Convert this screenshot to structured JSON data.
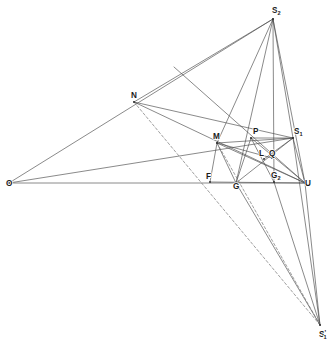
{
  "figure": {
    "kind": "geometry-diagram",
    "background_color": "#ffffff",
    "line_color": "#4a4a4a",
    "line_color_dark": "#3a3a3a",
    "label_color": "#1c1c1c",
    "width": 334,
    "height": 342
  },
  "points": {
    "O": {
      "label": "O",
      "sub": "",
      "prime": "",
      "x": 9,
      "y": 183,
      "label_x": 6,
      "label_y": 186
    },
    "N": {
      "label": "N",
      "sub": "",
      "prime": "",
      "x": 134,
      "y": 102,
      "label_x": 131,
      "label_y": 98
    },
    "M": {
      "label": "M",
      "sub": "",
      "prime": "",
      "x": 217,
      "y": 143,
      "label_x": 213,
      "label_y": 139
    },
    "P": {
      "label": "P",
      "sub": "",
      "prime": "",
      "x": 251,
      "y": 138,
      "label_x": 253,
      "label_y": 134
    },
    "S1": {
      "label": "S",
      "sub": "1",
      "prime": "",
      "x": 293,
      "y": 138,
      "label_x": 294,
      "label_y": 134
    },
    "S2": {
      "label": "S",
      "sub": "2",
      "prime": "",
      "x": 273,
      "y": 19,
      "label_x": 272,
      "label_y": 13
    },
    "S1p": {
      "label": "S",
      "sub": "1",
      "prime": "'",
      "x": 320,
      "y": 325,
      "label_x": 319,
      "label_y": 337
    },
    "L": {
      "label": "L",
      "sub": "",
      "prime": "",
      "x": 264,
      "y": 159,
      "label_x": 259,
      "label_y": 156
    },
    "Q": {
      "label": "Q",
      "sub": "",
      "prime": "",
      "x": 272,
      "y": 158,
      "label_x": 269,
      "label_y": 156
    },
    "F": {
      "label": "F",
      "sub": "",
      "prime": "",
      "x": 210,
      "y": 182,
      "label_x": 206,
      "label_y": 179
    },
    "G": {
      "label": "G",
      "sub": "",
      "prime": "",
      "x": 236,
      "y": 183,
      "label_x": 233,
      "label_y": 189
    },
    "G2": {
      "label": "G",
      "sub": "2",
      "prime": "",
      "x": 274,
      "y": 182,
      "label_x": 271,
      "label_y": 178
    },
    "U": {
      "label": "U",
      "sub": "",
      "prime": "",
      "x": 305,
      "y": 183,
      "label_x": 305,
      "label_y": 186
    },
    "T": {
      "label": "",
      "sub": "",
      "prime": "",
      "x": 174,
      "y": 67,
      "label_x": 0,
      "label_y": 0
    }
  },
  "solid_segments": [
    [
      "O",
      "S2"
    ],
    [
      "O",
      "S1"
    ],
    [
      "O",
      "U"
    ],
    [
      "N",
      "S2"
    ],
    [
      "N",
      "U"
    ],
    [
      "N",
      "S1"
    ],
    [
      "S2",
      "M"
    ],
    [
      "S2",
      "G"
    ],
    [
      "S2",
      "G2"
    ],
    [
      "S2",
      "S1"
    ],
    [
      "S2",
      "U"
    ],
    [
      "M",
      "S1"
    ],
    [
      "M",
      "G"
    ],
    [
      "M",
      "F"
    ],
    [
      "M",
      "Q"
    ],
    [
      "M",
      "U"
    ],
    [
      "P",
      "G"
    ],
    [
      "P",
      "U"
    ],
    [
      "P",
      "G2"
    ],
    [
      "P",
      "S1"
    ],
    [
      "S1",
      "G"
    ],
    [
      "S1",
      "U"
    ],
    [
      "S1",
      "S1p"
    ],
    [
      "U",
      "S1p"
    ],
    [
      "G",
      "S1p"
    ],
    [
      "G2",
      "S1p"
    ],
    [
      "T",
      "U"
    ],
    [
      "F",
      "U"
    ],
    [
      "L",
      "S1"
    ]
  ],
  "dashed_segments": [
    [
      "N",
      "S1p"
    ],
    [
      "M",
      "S1p"
    ]
  ],
  "labels_order": [
    "O",
    "N",
    "M",
    "P",
    "S1",
    "S2",
    "S1p",
    "L",
    "Q",
    "F",
    "G",
    "G2",
    "U"
  ]
}
